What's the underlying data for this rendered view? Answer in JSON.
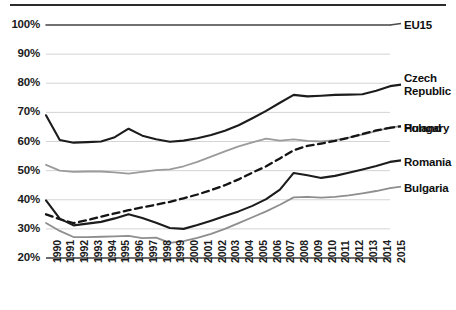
{
  "chart_data": {
    "type": "line",
    "title": "",
    "subtitle": "",
    "xlabel": "",
    "ylabel": "",
    "grid": true,
    "legend_position": "right",
    "xlim": [
      1990,
      2015
    ],
    "ylim": [
      20,
      100
    ],
    "ytick_labels": [
      "100%",
      "90%",
      "80%",
      "70%",
      "60%",
      "50%",
      "40%",
      "30%",
      "20%"
    ],
    "ytick_values": [
      100,
      90,
      80,
      70,
      60,
      50,
      40,
      30,
      20
    ],
    "categories": [
      "1990",
      "1991",
      "1992",
      "1993",
      "1994",
      "1995",
      "1996",
      "1997",
      "1998",
      "1999",
      "2000",
      "2001",
      "2002",
      "2003",
      "2004",
      "2005",
      "2006",
      "2007",
      "2008",
      "2009",
      "2010",
      "2011",
      "2012",
      "2013",
      "2014",
      "2015"
    ],
    "series": [
      {
        "name": "EU15",
        "color": "#4a4a4a",
        "style": "solid",
        "width": 1.6,
        "values": [
          100,
          100,
          100,
          100,
          100,
          100,
          100,
          100,
          100,
          100,
          100,
          100,
          100,
          100,
          100,
          100,
          100,
          100,
          100,
          100,
          100,
          100,
          100,
          100,
          100,
          100
        ]
      },
      {
        "name": "Czech Republic",
        "color": "#1c1c1c",
        "style": "solid",
        "width": 2.1,
        "values": [
          69.0,
          60.5,
          59.6,
          59.8,
          60.0,
          61.5,
          64.4,
          62.0,
          60.8,
          59.9,
          60.3,
          61.1,
          62.2,
          63.7,
          65.6,
          68.0,
          70.5,
          73.3,
          76.0,
          75.5,
          75.7,
          76.0,
          76.1,
          76.2,
          77.4,
          79.0
        ]
      },
      {
        "name": "Poland",
        "color": "#9b9b9b",
        "style": "solid",
        "width": 1.8,
        "values": [
          52.0,
          50.0,
          49.6,
          49.7,
          49.7,
          49.4,
          49.0,
          49.6,
          50.2,
          50.4,
          51.5,
          53.0,
          54.8,
          56.6,
          58.3,
          59.7,
          61.0,
          60.3,
          60.7,
          60.2,
          60.0,
          60.5,
          61.3,
          62.4,
          63.6,
          64.8
        ]
      },
      {
        "name": "Hungary",
        "color": "#141414",
        "style": "dashed",
        "width": 2.3,
        "values": [
          35.0,
          33.3,
          32.0,
          33.0,
          34.2,
          35.3,
          36.4,
          37.4,
          38.3,
          39.3,
          40.5,
          41.8,
          43.3,
          45.0,
          47.0,
          49.3,
          51.5,
          54.2,
          57.0,
          58.5,
          59.3,
          60.2,
          61.3,
          62.6,
          63.8,
          64.7
        ]
      },
      {
        "name": "Romania",
        "color": "#1c1c1c",
        "style": "solid",
        "width": 2.1,
        "values": [
          39.8,
          33.5,
          31.2,
          31.8,
          32.4,
          33.6,
          35.0,
          33.7,
          32.1,
          30.3,
          30.0,
          31.3,
          32.8,
          34.4,
          36.0,
          37.9,
          40.2,
          43.5,
          49.2,
          48.4,
          47.5,
          48.2,
          49.3,
          50.4,
          51.6,
          53.0
        ]
      },
      {
        "name": "Bulgaria",
        "color": "#8e8e8e",
        "style": "solid",
        "width": 1.8,
        "values": [
          32.0,
          29.3,
          27.2,
          27.2,
          27.3,
          27.4,
          27.6,
          26.8,
          27.0,
          25.2,
          25.8,
          26.9,
          28.3,
          30.0,
          32.0,
          34.0,
          36.0,
          38.3,
          40.8,
          41.0,
          40.7,
          41.0,
          41.5,
          42.2,
          43.0,
          44.0
        ]
      }
    ],
    "legend_entries": [
      {
        "label": "EU15",
        "multiline": false
      },
      {
        "label": "Czech Republic",
        "multiline": true
      },
      {
        "label": "Poland",
        "multiline": false
      },
      {
        "label": "Hungary",
        "multiline": false
      },
      {
        "label": "Romania",
        "multiline": false
      },
      {
        "label": "Bulgaria",
        "multiline": false
      }
    ]
  }
}
